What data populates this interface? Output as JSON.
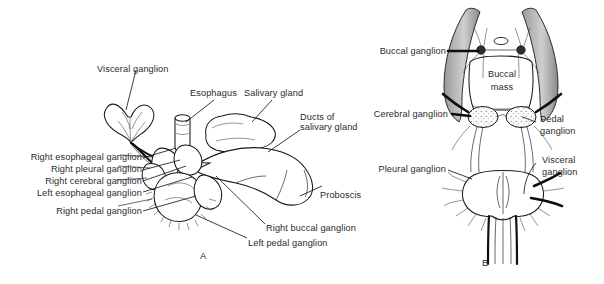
{
  "figure": {
    "background_color": "#ffffff",
    "ink_color": "#1a1a1a",
    "panels": [
      {
        "id": "A",
        "label": "A",
        "description": "Lateral dissection showing ganglia, esophagus, salivary gland and proboscis"
      },
      {
        "id": "B",
        "label": "B",
        "description": "Dorsal view of buccal mass and circumesophageal ganglion ring"
      }
    ]
  },
  "panel_a": {
    "id_label": "A",
    "labels": [
      {
        "name": "visceral-ganglion",
        "text": "Visceral ganglion"
      },
      {
        "name": "esophagus",
        "text": "Esophagus"
      },
      {
        "name": "salivary-gland",
        "text": "Salivary gland"
      },
      {
        "name": "ducts-of-salivary-gland-1",
        "text": "Ducts of"
      },
      {
        "name": "ducts-of-salivary-gland-2",
        "text": "salivary gland"
      },
      {
        "name": "right-esophageal-ganglion",
        "text": "Right esophageal ganglion"
      },
      {
        "name": "right-pleural-ganglion",
        "text": "Right pleural ganglion"
      },
      {
        "name": "right-cerebral-ganglion",
        "text": "Right cerebral ganglion"
      },
      {
        "name": "left-esophageal-ganglion",
        "text": "Left esophageal ganglion"
      },
      {
        "name": "right-pedal-ganglion",
        "text": "Right pedal ganglion"
      },
      {
        "name": "proboscis",
        "text": "Proboscis"
      },
      {
        "name": "right-buccal-ganglion",
        "text": "Right buccal ganglion"
      },
      {
        "name": "left-pedal-ganglion",
        "text": "Left pedal ganglion"
      }
    ]
  },
  "panel_b": {
    "id_label": "B",
    "labels": [
      {
        "name": "buccal-ganglion",
        "text": "Buccal ganglion"
      },
      {
        "name": "cerebral-ganglion",
        "text": "Cerebral ganglion"
      },
      {
        "name": "pedal-ganglion-1",
        "text": "Pedal"
      },
      {
        "name": "pedal-ganglion-2",
        "text": "ganglion"
      },
      {
        "name": "pleural-ganglion",
        "text": "Pleural ganglion"
      },
      {
        "name": "visceral-ganglion-1",
        "text": "Visceral"
      },
      {
        "name": "visceral-ganglion-2",
        "text": "ganglion"
      },
      {
        "name": "buccal-mass-1",
        "text": "Buccal"
      },
      {
        "name": "buccal-mass-2",
        "text": "mass"
      }
    ]
  }
}
